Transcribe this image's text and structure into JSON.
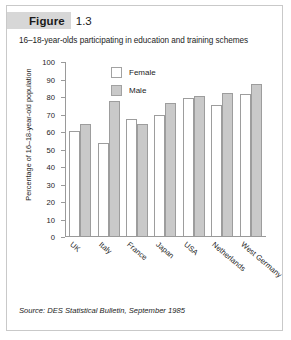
{
  "figure": {
    "badge_label": "Figure",
    "number": "1.3",
    "subtitle": "16–18-year-olds participating in education and training schemes",
    "source": "Source: DES Statistical Bulletin, September 1985"
  },
  "colors": {
    "badge_background": "#d7d7d7",
    "male_bar": "#c9c9c9",
    "female_bar": "#ffffff",
    "bar_outline": "#9d9d9d",
    "axis": "#9a9a9a",
    "text": "#1c1c1c",
    "card_border": "#c9c9c9"
  },
  "legend": {
    "position": "inside-top-center",
    "entries": [
      {
        "label": "Female",
        "swatch": "female"
      },
      {
        "label": "Male",
        "swatch": "male"
      }
    ]
  },
  "chart_data": {
    "type": "bar",
    "title": "16–18-year-olds participating in education and training schemes",
    "xlabel": "",
    "ylabel": "Percentage of 16–18-year-old population",
    "categories": [
      "UK",
      "Italy",
      "France",
      "Japan",
      "USA",
      "Netherlands",
      "West Germany"
    ],
    "series": [
      {
        "name": "Female",
        "values": [
          60,
          53,
          67,
          69,
          79,
          75,
          81
        ]
      },
      {
        "name": "Male",
        "values": [
          64,
          77,
          64,
          76,
          80,
          82,
          87
        ]
      }
    ],
    "ylim": [
      0,
      100
    ],
    "yticks": [
      0,
      10,
      20,
      30,
      40,
      50,
      60,
      70,
      80,
      90,
      100
    ],
    "ytick_labels": [
      "0",
      "10",
      "20",
      "30",
      "40",
      "50",
      "60",
      "70",
      "80",
      "90",
      "100"
    ],
    "grid": false,
    "legend_position": "upper center"
  }
}
